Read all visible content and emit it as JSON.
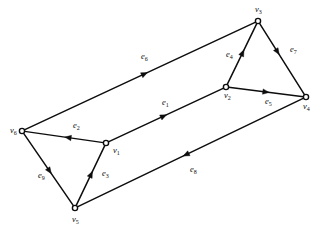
{
  "diagram": {
    "type": "directed-graph",
    "title": "",
    "background_color": "#ffffff",
    "stroke_color": "#0d0d0d",
    "vertices": [
      {
        "id": "v1",
        "letter": "v",
        "subscript": "1",
        "label": "v1",
        "x": 106,
        "y": 143,
        "label_x": 113,
        "label_y": 151
      },
      {
        "id": "v2",
        "letter": "v",
        "subscript": "2",
        "label": "v2",
        "x": 226,
        "y": 87,
        "label_x": 224,
        "label_y": 96
      },
      {
        "id": "v3",
        "letter": "v",
        "subscript": "3",
        "label": "v3",
        "x": 258,
        "y": 21,
        "label_x": 255,
        "label_y": 10
      },
      {
        "id": "v4",
        "letter": "v",
        "subscript": "4",
        "label": "v4",
        "x": 306,
        "y": 97,
        "label_x": 303,
        "label_y": 107
      },
      {
        "id": "v5",
        "letter": "v",
        "subscript": "5",
        "label": "v5",
        "x": 75,
        "y": 208,
        "label_x": 72,
        "label_y": 220
      },
      {
        "id": "v6",
        "letter": "v",
        "subscript": "6",
        "label": "v6",
        "x": 22,
        "y": 131,
        "label_x": 10,
        "label_y": 131
      }
    ],
    "edges": [
      {
        "id": "e1",
        "letter": "e",
        "subscript": "1",
        "label": "e1",
        "from": "v1",
        "to": "v2",
        "label_x": 162,
        "label_y": 103,
        "arrow_t": 0.48
      },
      {
        "id": "e2",
        "letter": "e",
        "subscript": "2",
        "label": "e2",
        "from": "v1",
        "to": "v6",
        "label_x": 73,
        "label_y": 126,
        "arrow_t": 0.45
      },
      {
        "id": "e3",
        "letter": "e",
        "subscript": "3",
        "label": "e3",
        "from": "v5",
        "to": "v1",
        "label_x": 102,
        "label_y": 174,
        "arrow_t": 0.52
      },
      {
        "id": "e4",
        "letter": "e",
        "subscript": "4",
        "label": "e4",
        "from": "v2",
        "to": "v3",
        "label_x": 226,
        "label_y": 55,
        "arrow_t": 0.52
      },
      {
        "id": "e5",
        "letter": "e",
        "subscript": "5",
        "label": "e5",
        "from": "v2",
        "to": "v4",
        "label_x": 265,
        "label_y": 102,
        "arrow_t": 0.5
      },
      {
        "id": "e6",
        "letter": "e",
        "subscript": "6",
        "label": "e6",
        "from": "v6",
        "to": "v3",
        "label_x": 141,
        "label_y": 57,
        "arrow_t": 0.52
      },
      {
        "id": "e7",
        "letter": "e",
        "subscript": "7",
        "label": "e7",
        "from": "v3",
        "to": "v4",
        "label_x": 290,
        "label_y": 50,
        "arrow_t": 0.4
      },
      {
        "id": "e8",
        "letter": "e",
        "subscript": "8",
        "label": "e8",
        "from": "v4",
        "to": "v5",
        "label_x": 190,
        "label_y": 170,
        "arrow_t": 0.52
      },
      {
        "id": "e9",
        "letter": "e",
        "subscript": "9",
        "label": "e9",
        "from": "v6",
        "to": "v5",
        "label_x": 38,
        "label_y": 176,
        "arrow_t": 0.52
      }
    ]
  }
}
